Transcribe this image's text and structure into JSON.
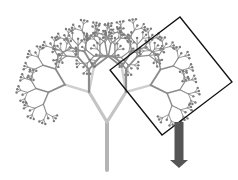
{
  "diagram": {
    "colors": {
      "background": "#ffffff",
      "branch": "#8c8c8c",
      "trunk_light": "#d8d8d8",
      "leaf_dot": "#7a7a7a",
      "frame": "#111111",
      "arrow": "#555555"
    },
    "tree": {
      "root": [
        107,
        170
      ],
      "trunk_top": [
        107,
        122
      ],
      "depth": 7,
      "first_fork": [
        {
          "end": [
            89,
            92
          ]
        },
        {
          "end": [
            126,
            92
          ]
        }
      ],
      "spread_deg": 42,
      "length_ratio": 0.72,
      "base_width": 4
    },
    "frame": {
      "points": [
        [
          180,
          17
        ],
        [
          232,
          82
        ],
        [
          162,
          135
        ],
        [
          110,
          70
        ]
      ]
    },
    "arrow": {
      "shaft_x": 179,
      "shaft_top": 122,
      "shaft_bottom": 160,
      "shaft_width": 9,
      "head_half_width": 9,
      "tip_y": 168
    }
  }
}
